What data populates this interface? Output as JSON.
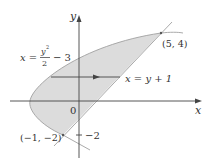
{
  "diagram": {
    "axes": {
      "x_label": "x",
      "y_label": "y",
      "origin_label": "0"
    },
    "curves": [
      {
        "name": "parabola",
        "equation_lhs": "x =",
        "equation_num": "y",
        "equation_exp": "2",
        "equation_den": "2",
        "equation_rest": "− 3"
      },
      {
        "name": "line",
        "equation": "x = y + 1"
      }
    ],
    "points": [
      {
        "label": "(5, 4)",
        "x": 5,
        "y": 4
      },
      {
        "label": "(−1, −2)",
        "x": -1,
        "y": -2
      }
    ],
    "ticks": {
      "y_minus2": "−2"
    },
    "colors": {
      "region": "#d9d9d9",
      "lines": "#555555",
      "curve": "#9a9a9a"
    }
  }
}
